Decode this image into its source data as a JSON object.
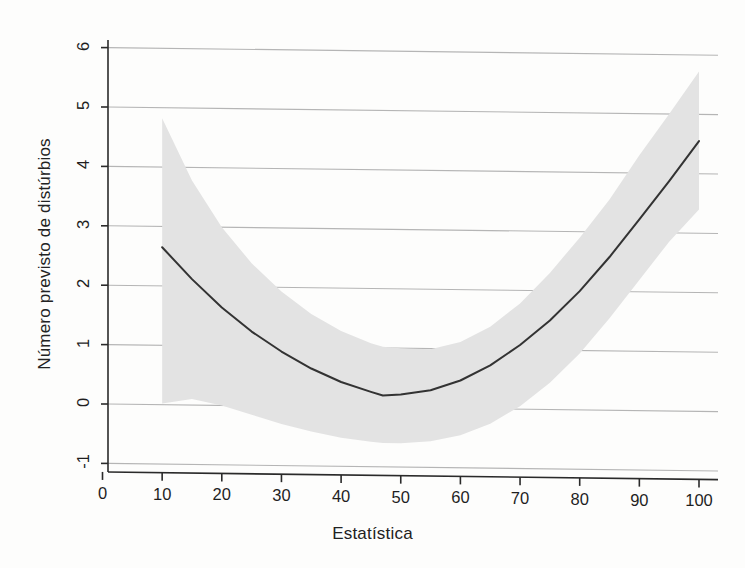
{
  "chart_data": {
    "type": "line",
    "title": "",
    "xlabel": "Estatística",
    "ylabel": "Número previsto de distúrbios",
    "xlim": [
      0,
      103
    ],
    "ylim": [
      -1.35,
      6.3
    ],
    "xticks": [
      0,
      10,
      20,
      30,
      40,
      50,
      60,
      70,
      80,
      90,
      100
    ],
    "yticks": [
      -1,
      0,
      1,
      2,
      3,
      4,
      5,
      6
    ],
    "xtick_labels": [
      "0",
      "10",
      "20",
      "30",
      "40",
      "50",
      "60",
      "70",
      "80",
      "90",
      "100"
    ],
    "ytick_labels": [
      "-1",
      "0",
      "1",
      "2",
      "3",
      "4",
      "5",
      "6"
    ],
    "grid": "horizontal",
    "legend": "none",
    "series": [
      {
        "name": "Número previsto de distúrbios",
        "type": "line",
        "color": "#333333",
        "x": [
          10,
          15,
          20,
          25,
          30,
          35,
          40,
          45,
          47,
          50,
          55,
          60,
          65,
          70,
          75,
          80,
          85,
          90,
          95,
          100
        ],
        "values": [
          2.65,
          2.12,
          1.65,
          1.25,
          0.92,
          0.64,
          0.42,
          0.26,
          0.2,
          0.22,
          0.3,
          0.47,
          0.73,
          1.08,
          1.5,
          2.0,
          2.58,
          3.22,
          3.87,
          4.55
        ]
      },
      {
        "name": "Intervalo de confiança (superior)",
        "type": "band-upper",
        "color": "#e3e3e3",
        "x": [
          10,
          15,
          20,
          25,
          30,
          35,
          40,
          45,
          47,
          50,
          55,
          60,
          65,
          70,
          75,
          80,
          85,
          90,
          95,
          100
        ],
        "values": [
          4.82,
          3.78,
          3.0,
          2.4,
          1.93,
          1.56,
          1.28,
          1.08,
          1.02,
          1.0,
          0.99,
          1.12,
          1.38,
          1.78,
          2.3,
          2.9,
          3.55,
          4.3,
          5.0,
          5.72
        ]
      },
      {
        "name": "Intervalo de confiança (inferior)",
        "type": "band-lower",
        "color": "#e3e3e3",
        "x": [
          10,
          15,
          20,
          25,
          30,
          35,
          40,
          45,
          47,
          50,
          55,
          60,
          65,
          70,
          75,
          80,
          85,
          90,
          95,
          100
        ],
        "values": [
          0.02,
          0.1,
          0.0,
          -0.15,
          -0.3,
          -0.42,
          -0.52,
          -0.58,
          -0.6,
          -0.6,
          -0.56,
          -0.45,
          -0.25,
          0.05,
          0.45,
          0.95,
          1.55,
          2.2,
          2.85,
          3.4
        ]
      }
    ]
  },
  "axes": {
    "x_title": "Estatística",
    "y_title": "Número previsto de distúrbios"
  },
  "colors": {
    "band": "#e3e3e3",
    "line": "#333333",
    "grid": "#b5b5b5",
    "axis": "#2a2a2a",
    "background": "#fdfdfc"
  }
}
